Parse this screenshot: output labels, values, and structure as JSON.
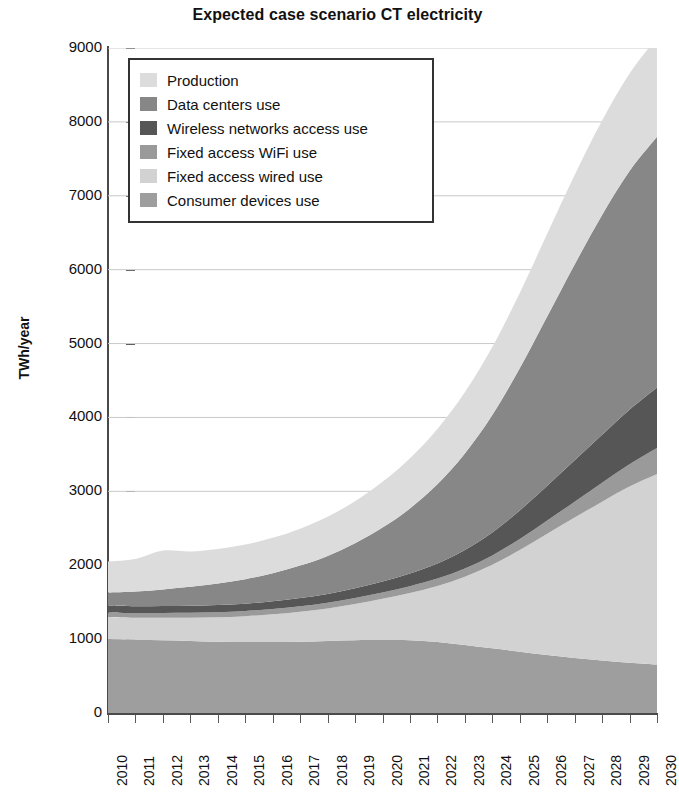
{
  "chart_data": {
    "type": "area",
    "title": "Expected case scenario CT electricity",
    "xlabel": "",
    "ylabel": "TWh/year",
    "ylim": [
      0,
      9000
    ],
    "xlim": [
      2010,
      2030
    ],
    "ytick_step": 1000,
    "grid": true,
    "stacked": true,
    "legend_position": "top-left-inside",
    "yticks": [
      "0",
      "1000",
      "2000",
      "3000",
      "4000",
      "5000",
      "6000",
      "7000",
      "8000",
      "9000"
    ],
    "categories": [
      "2010",
      "2011",
      "2012",
      "2013",
      "2014",
      "2015",
      "2016",
      "2017",
      "2018",
      "2019",
      "2020",
      "2021",
      "2022",
      "2023",
      "2024",
      "2025",
      "2026",
      "2027",
      "2028",
      "2029",
      "2030"
    ],
    "series": [
      {
        "name": "Consumer devices use",
        "color": "#9e9e9e",
        "values": [
          1000,
          990,
          985,
          975,
          965,
          960,
          960,
          965,
          975,
          985,
          990,
          985,
          960,
          920,
          875,
          830,
          785,
          745,
          710,
          680,
          655
        ]
      },
      {
        "name": "Fixed access wired use",
        "color": "#d2d2d2",
        "values": [
          300,
          300,
          305,
          315,
          330,
          350,
          375,
          405,
          440,
          490,
          555,
          640,
          760,
          925,
          1130,
          1375,
          1640,
          1900,
          2150,
          2385,
          2580
        ]
      },
      {
        "name": "Fixed access WiFi use",
        "color": "#9a9a9a",
        "values": [
          60,
          62,
          64,
          66,
          68,
          70,
          72,
          75,
          78,
          82,
          86,
          92,
          100,
          112,
          128,
          150,
          180,
          215,
          255,
          300,
          350
        ]
      },
      {
        "name": "Wireless networks access use",
        "color": "#565656",
        "values": [
          90,
          92,
          94,
          96,
          98,
          100,
          104,
          110,
          118,
          130,
          148,
          172,
          205,
          250,
          310,
          385,
          470,
          560,
          650,
          740,
          820
        ]
      },
      {
        "name": "Data centers use",
        "color": "#878787",
        "values": [
          180,
          200,
          225,
          255,
          290,
          330,
          380,
          440,
          515,
          610,
          730,
          880,
          1070,
          1305,
          1590,
          1925,
          2290,
          2650,
          2975,
          3230,
          3395
        ]
      },
      {
        "name": "Production",
        "color": "#dcdcdc",
        "values": [
          420,
          440,
          525,
          480,
          470,
          470,
          480,
          500,
          530,
          570,
          620,
          680,
          750,
          830,
          920,
          1020,
          1120,
          1210,
          1280,
          1320,
          1340
        ]
      }
    ],
    "stack_order_bottom_to_top": [
      "Consumer devices use",
      "Fixed access wired use",
      "Fixed access WiFi use",
      "Wireless networks access use",
      "Data centers use",
      "Production"
    ],
    "totals": [
      2050,
      2084,
      2198,
      2187,
      2221,
      2280,
      2371,
      2495,
      2656,
      2867,
      3129,
      3449,
      3845,
      4342,
      4953,
      5685,
      6485,
      7280,
      8020,
      8655,
      9140
    ]
  },
  "legend": {
    "items": [
      {
        "label": "Production",
        "color": "#dcdcdc"
      },
      {
        "label": "Data centers use",
        "color": "#878787"
      },
      {
        "label": "Wireless networks access use",
        "color": "#565656"
      },
      {
        "label": "Fixed access WiFi use",
        "color": "#9a9a9a"
      },
      {
        "label": "Fixed access wired use",
        "color": "#d2d2d2"
      },
      {
        "label": "Consumer devices use",
        "color": "#9e9e9e"
      }
    ]
  },
  "style": {
    "grid_color": "#c9c9c9",
    "axis_color": "#4a4a4a",
    "text_color": "#111111",
    "background": "#ffffff"
  }
}
